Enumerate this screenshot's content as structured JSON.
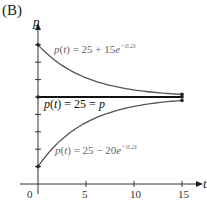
{
  "panel_label": "(B)",
  "chart_data": {
    "type": "line",
    "title": "",
    "xlabel": "t",
    "ylabel": "p",
    "xlim": [
      0,
      15
    ],
    "ylim": [
      0,
      40
    ],
    "x_ticks": [
      0,
      5,
      10,
      15
    ],
    "y_ticks": [
      5,
      10,
      15,
      20,
      25,
      30,
      35,
      40
    ],
    "grid": false,
    "series": [
      {
        "name": "p(t) = 25 + 15e^{-0.2t}",
        "formula": "25 + 15*exp(-0.2t)",
        "x": [
          0,
          1,
          2,
          3,
          4,
          5,
          6,
          7,
          8,
          9,
          10,
          11,
          12,
          13,
          14,
          15
        ],
        "values": [
          40,
          37.28,
          35.06,
          33.23,
          31.74,
          30.52,
          29.52,
          28.7,
          28.03,
          27.48,
          27.03,
          26.66,
          26.36,
          26.11,
          25.91,
          25.75
        ]
      },
      {
        "name": "p(t) = 25 = p̄",
        "formula": "25",
        "x": [
          0,
          15
        ],
        "values": [
          25,
          25
        ]
      },
      {
        "name": "p(t) = 25 − 20e^{-0.2t}",
        "formula": "25 - 20*exp(-0.2t)",
        "x": [
          0,
          1,
          2,
          3,
          4,
          5,
          6,
          7,
          8,
          9,
          10,
          11,
          12,
          13,
          14,
          15
        ],
        "values": [
          5,
          8.63,
          11.59,
          14.02,
          16.01,
          17.64,
          18.98,
          20.07,
          20.96,
          21.69,
          22.29,
          22.79,
          23.19,
          23.52,
          23.78,
          24.0
        ]
      }
    ],
    "annotations": {
      "upper": {
        "p": "p",
        "t": "t",
        "eq": "= 25 + 15",
        "e": "e",
        "exp": "−0.2t"
      },
      "middle": {
        "p": "p",
        "t": "t",
        "eq": "= 25 = ",
        "pbar": "p"
      },
      "lower": {
        "p": "p",
        "t": "t",
        "eq": "= 25 − 20",
        "e": "e",
        "exp": "−0.2t"
      }
    }
  }
}
